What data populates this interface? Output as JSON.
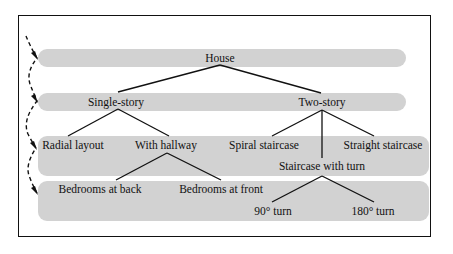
{
  "diagram": {
    "type": "tree",
    "levels": 4,
    "nodes": {
      "root": "House",
      "single_story": "Single-story",
      "two_story": "Two-story",
      "radial_layout": "Radial layout",
      "with_hallway": "With hallway",
      "spiral_staircase": "Spiral staircase",
      "staircase_with_turn": "Staircase with turn",
      "straight_staircase": "Straight staircase",
      "bedrooms_at_back": "Bedrooms at back",
      "bedrooms_at_front": "Bedrooms at front",
      "turn_90": "90° turn",
      "turn_180": "180° turn"
    },
    "edges": [
      [
        "House",
        "Single-story"
      ],
      [
        "House",
        "Two-story"
      ],
      [
        "Single-story",
        "Radial layout"
      ],
      [
        "Single-story",
        "With hallway"
      ],
      [
        "Two-story",
        "Spiral staircase"
      ],
      [
        "Two-story",
        "Staircase with turn"
      ],
      [
        "Two-story",
        "Straight staircase"
      ],
      [
        "With hallway",
        "Bedrooms at back"
      ],
      [
        "With hallway",
        "Bedrooms at front"
      ],
      [
        "Staircase with turn",
        "90° turn"
      ],
      [
        "Staircase with turn",
        "180° turn"
      ]
    ],
    "colors": {
      "band": "#d2d2d2",
      "line": "#111111",
      "border": "#111111"
    }
  }
}
